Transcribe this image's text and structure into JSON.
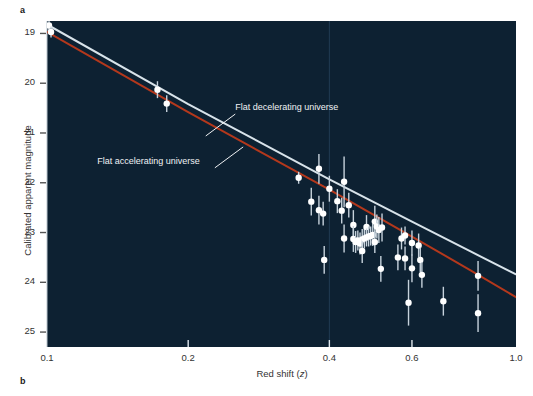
{
  "figure": {
    "panel_a_label": "a",
    "panel_b_label": "b",
    "background_plot": "#0d2132",
    "background_page": "#ffffff"
  },
  "chart_data": {
    "type": "scatter",
    "title": "",
    "xlabel": "Red shift (z)",
    "ylabel": "Calibrated apparent magnitude",
    "xscale": "log",
    "xlim": [
      0.1,
      1.0
    ],
    "ylim": [
      25.3,
      18.75
    ],
    "y_inverted": true,
    "grid": false,
    "xticks": [
      0.1,
      0.2,
      0.4,
      0.6,
      1.0
    ],
    "xticklabels": [
      "0.1",
      "0.2",
      "0.4",
      "0.6",
      "1.0"
    ],
    "yticks": [
      19,
      20,
      21,
      22,
      23,
      24,
      25
    ],
    "yticklabels": [
      "19",
      "20",
      "21",
      "22",
      "23",
      "24",
      "25"
    ],
    "legend_position": "inline-annotations",
    "annotations": [
      {
        "text": "Flat decelerating universe",
        "color": "#f0f2f4",
        "text_x": 0.252,
        "text_y": 20.52,
        "leader_from_x": 0.252,
        "leader_from_y": 20.62,
        "leader_to_x": 0.218,
        "leader_to_y": 21.06
      },
      {
        "text": "Flat accelerating universe",
        "color": "#f0f2f4",
        "text_x": 0.128,
        "text_y": 21.6,
        "leader_from_x": 0.228,
        "leader_from_y": 21.7,
        "leader_to_x": 0.262,
        "leader_to_y": 21.28
      }
    ],
    "series": [
      {
        "name": "Flat decelerating universe",
        "type": "line",
        "color": "#d8e3ea",
        "linewidth": 2.0,
        "points": [
          {
            "x": 0.1,
            "y": 18.82
          },
          {
            "x": 0.2,
            "y": 20.42
          },
          {
            "x": 0.4,
            "y": 21.93
          },
          {
            "x": 0.6,
            "y": 22.78
          },
          {
            "x": 0.8,
            "y": 23.38
          },
          {
            "x": 1.0,
            "y": 23.84
          }
        ]
      },
      {
        "name": "Flat accelerating universe",
        "type": "line",
        "color": "#b4381c",
        "linewidth": 2.0,
        "points": [
          {
            "x": 0.1,
            "y": 18.97
          },
          {
            "x": 0.2,
            "y": 20.58
          },
          {
            "x": 0.4,
            "y": 22.14
          },
          {
            "x": 0.6,
            "y": 23.08
          },
          {
            "x": 0.8,
            "y": 23.76
          },
          {
            "x": 1.0,
            "y": 24.3
          }
        ]
      },
      {
        "name": "Type Ia supernovae",
        "type": "scatter",
        "marker": "circle",
        "color": "#ffffff",
        "errorbar_color": "#c6d2dc",
        "points": [
          {
            "x": 0.101,
            "y": 18.84,
            "yerr": 0.13
          },
          {
            "x": 0.102,
            "y": 18.97,
            "yerr": 0.11
          },
          {
            "x": 0.172,
            "y": 20.13,
            "yerr": 0.17
          },
          {
            "x": 0.18,
            "y": 20.41,
            "yerr": 0.17
          },
          {
            "x": 0.344,
            "y": 21.9,
            "yerr": 0.12
          },
          {
            "x": 0.366,
            "y": 22.38,
            "yerr": 0.28
          },
          {
            "x": 0.38,
            "y": 21.72,
            "yerr": 0.3
          },
          {
            "x": 0.38,
            "y": 22.55,
            "yerr": 0.29
          },
          {
            "x": 0.388,
            "y": 22.62,
            "yerr": 0.24
          },
          {
            "x": 0.39,
            "y": 23.55,
            "yerr": 0.28
          },
          {
            "x": 0.4,
            "y": 22.12,
            "yerr": 0.26
          },
          {
            "x": 0.416,
            "y": 22.37,
            "yerr": 0.24
          },
          {
            "x": 0.425,
            "y": 22.56,
            "yerr": 0.26
          },
          {
            "x": 0.43,
            "y": 23.12,
            "yerr": 0.28
          },
          {
            "x": 0.43,
            "y": 21.98,
            "yerr": 0.51
          },
          {
            "x": 0.44,
            "y": 22.45,
            "yerr": 0.25
          },
          {
            "x": 0.45,
            "y": 22.85,
            "yerr": 0.3
          },
          {
            "x": 0.45,
            "y": 23.13,
            "yerr": 0.26
          },
          {
            "x": 0.455,
            "y": 23.19,
            "yerr": 0.22
          },
          {
            "x": 0.46,
            "y": 23.16,
            "yerr": 0.2
          },
          {
            "x": 0.465,
            "y": 23.22,
            "yerr": 0.22
          },
          {
            "x": 0.47,
            "y": 23.14,
            "yerr": 0.21
          },
          {
            "x": 0.47,
            "y": 23.37,
            "yerr": 0.24
          },
          {
            "x": 0.475,
            "y": 23.12,
            "yerr": 0.2
          },
          {
            "x": 0.48,
            "y": 22.89,
            "yerr": 0.24
          },
          {
            "x": 0.48,
            "y": 23.1,
            "yerr": 0.18
          },
          {
            "x": 0.485,
            "y": 23.08,
            "yerr": 0.2
          },
          {
            "x": 0.49,
            "y": 23.07,
            "yerr": 0.19
          },
          {
            "x": 0.495,
            "y": 23.05,
            "yerr": 0.22
          },
          {
            "x": 0.5,
            "y": 22.78,
            "yerr": 0.32
          },
          {
            "x": 0.5,
            "y": 23.19,
            "yerr": 0.22
          },
          {
            "x": 0.505,
            "y": 22.88,
            "yerr": 0.24
          },
          {
            "x": 0.51,
            "y": 22.95,
            "yerr": 0.26
          },
          {
            "x": 0.515,
            "y": 23.73,
            "yerr": 0.26
          },
          {
            "x": 0.518,
            "y": 22.9,
            "yerr": 0.28
          },
          {
            "x": 0.56,
            "y": 23.5,
            "yerr": 0.26
          },
          {
            "x": 0.57,
            "y": 23.12,
            "yerr": 0.22
          },
          {
            "x": 0.58,
            "y": 23.06,
            "yerr": 0.18
          },
          {
            "x": 0.58,
            "y": 23.52,
            "yerr": 0.24
          },
          {
            "x": 0.59,
            "y": 24.41,
            "yerr": 0.46
          },
          {
            "x": 0.6,
            "y": 23.21,
            "yerr": 0.25
          },
          {
            "x": 0.6,
            "y": 23.72,
            "yerr": 0.28
          },
          {
            "x": 0.62,
            "y": 23.26,
            "yerr": 0.24
          },
          {
            "x": 0.625,
            "y": 23.55,
            "yerr": 0.25
          },
          {
            "x": 0.63,
            "y": 23.85,
            "yerr": 0.26
          },
          {
            "x": 0.7,
            "y": 24.38,
            "yerr": 0.29
          },
          {
            "x": 0.83,
            "y": 23.87,
            "yerr": 0.3
          },
          {
            "x": 0.83,
            "y": 24.62,
            "yerr": 0.38
          }
        ]
      }
    ]
  }
}
